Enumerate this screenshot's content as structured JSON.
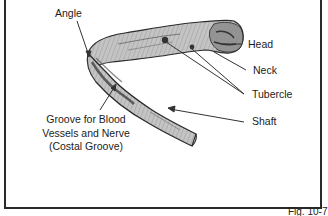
{
  "figure": {
    "caption": "Fig. 10-7",
    "labels": {
      "angle": "Angle",
      "head": "Head",
      "neck": "Neck",
      "tubercle": "Tubercle",
      "shaft": "Shaft",
      "groove_lines": [
        "Groove for Blood",
        "Vessels and Nerve",
        "(Costal Groove)"
      ]
    },
    "colors": {
      "bone_fill": "#b8b8b8",
      "bone_shade": "#5a5a5a",
      "outline": "#2a2a2a",
      "leader_line": "#333333",
      "border": "#2a2a2a"
    }
  }
}
